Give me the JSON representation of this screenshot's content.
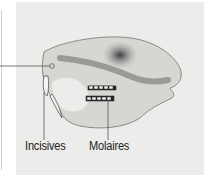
{
  "diagram": {
    "labels": {
      "incisors": "Incisives",
      "molars": "Molaires"
    },
    "colors": {
      "panel_background": "#ececea",
      "skull_fill": "#d6d6d3",
      "skull_shadow": "#8a8a88",
      "leader_line": "#555555",
      "text": "#222222"
    }
  }
}
